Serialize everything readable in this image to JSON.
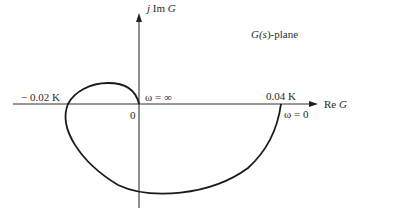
{
  "diagram": {
    "type": "nyquist-plot",
    "plane_label": {
      "prefix": "G(",
      "var": "s",
      "suffix": ")-plane"
    },
    "axes": {
      "imag_label": {
        "j": "j",
        "text": " Im ",
        "G": "G"
      },
      "real_label": {
        "text": "Re ",
        "G": "G"
      }
    },
    "points": {
      "neg_crossing": "− 0.02 K",
      "pos_crossing": "0.04 K",
      "origin": "0",
      "omega_inf": "ω = ∞",
      "omega_zero": "ω = 0"
    },
    "colors": {
      "line": "#1a1a1a",
      "background": "#ffffff"
    }
  }
}
